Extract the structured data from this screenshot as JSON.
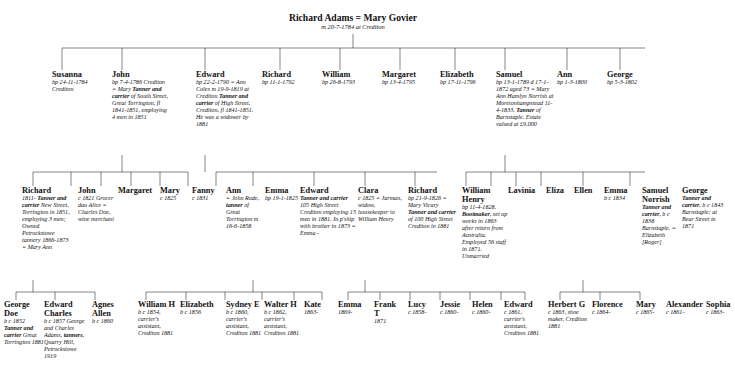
{
  "root": {
    "name": "Richard Adams = Mary Govier",
    "detail": "m 20-7-1784 at Crediton"
  },
  "gen2": [
    {
      "name": "Susanna",
      "detail": "bp 24-11-1784 Crediton"
    },
    {
      "name": "John",
      "detail": "bp 7-4-1786 Crediton = Mary <b>Tanner and carrier</b> of South Street, Great Torrington, fl 1841-1851, employing 4 men in 1851"
    },
    {
      "name": "Edward",
      "detail": "bp 22-2-1790 = Ann Coles m 19-9-1819 at Crediton <b>Tanner and carrier</b> of High Street, Crediton, fl 1841-1851. He was a widower by 1881"
    },
    {
      "name": "Richard",
      "detail": "bp 11-1-1792"
    },
    {
      "name": "William",
      "detail": "bp 26-8-1793"
    },
    {
      "name": "Margaret",
      "detail": "bp 13-4-1795"
    },
    {
      "name": "Elizabeth",
      "detail": "bp 17-11-1796"
    },
    {
      "name": "Samuel",
      "detail": "bp 13-1-1789 d 17-1-1872 aged 73 = Mary Ann Hamlyn Norrish at Moretonhampstead 11-4-1833. <b>Tanner</b> of Barnstaple. Estate valued at £9,000"
    },
    {
      "name": "Ann",
      "detail": "bp 1-3-1800"
    },
    {
      "name": "George",
      "detail": "bp 5-3-1802"
    }
  ],
  "gen3": [
    {
      "name": "Richard",
      "detail": "1811- <b>Tanner and carrier</b> New Street, Torrington in 1851, employing 3 men; Owned Petrockstowe tannery 1866-1873 = Mary Ann"
    },
    {
      "name": "John",
      "detail": "c 1821 Grocer dau Alice = Charles Doe, wine merchant"
    },
    {
      "name": "Margaret",
      "detail": ""
    },
    {
      "name": "Mary",
      "detail": "c 1825"
    },
    {
      "name": "Fanny",
      "detail": "c 1831"
    },
    {
      "name": "Ann",
      "detail": "= John Rude, <b>tanner</b> of Great Torrington m 16-6-1858"
    },
    {
      "name": "Emma",
      "detail": "bp 19-1-1825"
    },
    {
      "name": "Edward",
      "detail": "<b>Tanner and carrier</b> 105 High Street Crediton employing 15 men in 1881. In p'ship with brother in 1873 = Emma -"
    },
    {
      "name": "Clara",
      "detail": "c 1825 = Jarman, widow, housekeeper to William Henry"
    },
    {
      "name": "Richard",
      "detail": "bp 21-9-1826 = Mary Vicary <b>Tanner and carrier</b> of 100 High Street Crediton in 1881"
    },
    {
      "name": "William Henry",
      "detail": "bp 11-4-1828. <b>Bootmaker</b>, set up works in 1863 after return from Australia. Employed 56 staff in 1871. Unmarried"
    },
    {
      "name": "Lavinia",
      "detail": ""
    },
    {
      "name": "Eliza",
      "detail": ""
    },
    {
      "name": "Ellen",
      "detail": ""
    },
    {
      "name": "Emma",
      "detail": "b c 1834"
    },
    {
      "name": "Samuel Norrish",
      "detail": "<b>Tanner and carrier</b>, b c 1838 Barnstaple. = Elizabeth [Roger]"
    },
    {
      "name": "George",
      "detail": "<b>Tanner and carrier</b>, b c 1843 Barnstaple; at Bear Street in 1871"
    }
  ],
  "gen4": [
    {
      "name": "George Doe",
      "detail": "b c 1852 <b>Tanner and carrier</b> Great Torrington 1881"
    },
    {
      "name": "Edward Charles",
      "detail": "b c 1857 George and Charles Adams, <b>tanners</b>, Quarry Hill, Petrockstowe 1919"
    },
    {
      "name": "Agnes Allen",
      "detail": "b c 1860"
    },
    {
      "name": "William H",
      "detail": "b c 1854, carrier's assistant, Crediton 1881"
    },
    {
      "name": "Elizabeth",
      "detail": "b c 1856"
    },
    {
      "name": "Sydney E",
      "detail": "b c 1860, carrier's assistant, Crediton 1881"
    },
    {
      "name": "Walter H",
      "detail": "b c 1862, carrier's assistant, Crediton 1881"
    },
    {
      "name": "Kate",
      "detail": "1863-"
    },
    {
      "name": "Emma",
      "detail": "1869-"
    },
    {
      "name": "Frank T",
      "detail": "1871"
    },
    {
      "name": "Lucy",
      "detail": "c 1858-"
    },
    {
      "name": "Jessie",
      "detail": "c 1860-"
    },
    {
      "name": "Helen",
      "detail": "c 1860-"
    },
    {
      "name": "Edward",
      "detail": "c 1861, carrier's assistant, Crediton 1881"
    },
    {
      "name": "Herbert G",
      "detail": "c 1863, shoe maker, Crediton 1881"
    },
    {
      "name": "Florence",
      "detail": "c 1864-"
    },
    {
      "name": "Mary",
      "detail": "c 1865-"
    },
    {
      "name": "Alexander",
      "detail": "c 1861-"
    },
    {
      "name": "Sophia",
      "detail": "c 1863-"
    }
  ]
}
